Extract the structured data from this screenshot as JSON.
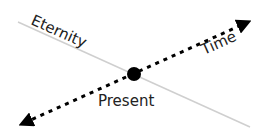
{
  "diagram": {
    "labels": {
      "eternity": "Eternity",
      "time": "Time",
      "present": "Present"
    },
    "colors": {
      "eternity_line": "#cfcfcf",
      "time_arrow": "#000000",
      "present_dot": "#000000",
      "text": "#222222"
    },
    "elements": {
      "eternity_line": {
        "x1": 18,
        "y1": 22,
        "x2": 250,
        "y2": 127
      },
      "time_arrow": {
        "x1": 22,
        "y1": 124,
        "x2": 248,
        "y2": 22,
        "style": "dashed",
        "arrowheads": "both"
      },
      "present_dot": {
        "cx": 134,
        "cy": 74,
        "r": 7
      }
    }
  }
}
